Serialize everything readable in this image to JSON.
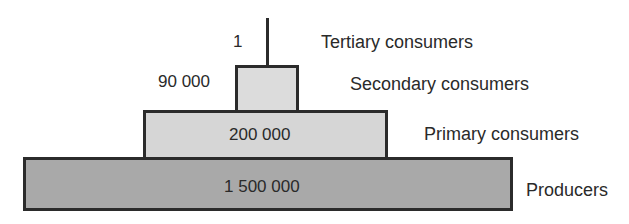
{
  "diagram": {
    "type": "pyramid of numbers",
    "levels": [
      {
        "name": "Tertiary consumers",
        "value": "1"
      },
      {
        "name": "Secondary consumers",
        "value": "90 000"
      },
      {
        "name": "Primary consumers",
        "value": "200 000"
      },
      {
        "name": "Producers",
        "value": "1 500 000"
      }
    ],
    "colors": {
      "outline": "#2b2b2b",
      "secondary_fill": "#dcdcdc",
      "primary_fill": "#d6d6d6",
      "producers_fill": "#a9a9a9"
    }
  }
}
